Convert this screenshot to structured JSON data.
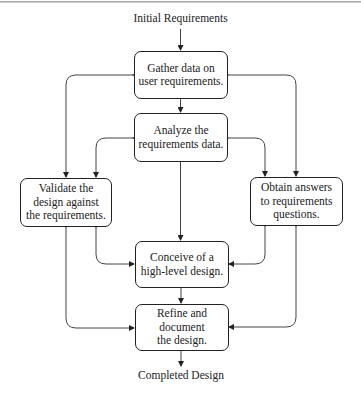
{
  "diagram": {
    "type": "flowchart",
    "input_label": "Initial Requirements",
    "output_label": "Completed Design",
    "nodes": {
      "gather": "Gather data on\nuser requirements.",
      "analyze": "Analyze the\nrequirements data.",
      "validate": "Validate the\ndesign against\nthe requirements.",
      "obtain": "Obtain answers\nto requirements\nquestions.",
      "conceive": "Conceive of a\nhigh-level design.",
      "refine": "Refine and\ndocument\nthe design."
    },
    "edges": [
      {
        "from": "Initial Requirements",
        "to": "gather"
      },
      {
        "from": "gather",
        "to": "analyze"
      },
      {
        "from": "analyze",
        "to": "conceive"
      },
      {
        "from": "conceive",
        "to": "refine"
      },
      {
        "from": "refine",
        "to": "Completed Design"
      },
      {
        "between": [
          "validate",
          "gather"
        ],
        "bidirectional": true
      },
      {
        "between": [
          "validate",
          "analyze"
        ],
        "bidirectional": true
      },
      {
        "between": [
          "validate",
          "conceive"
        ],
        "bidirectional": true
      },
      {
        "between": [
          "validate",
          "refine"
        ],
        "bidirectional": true
      },
      {
        "between": [
          "obtain",
          "gather"
        ],
        "bidirectional": true
      },
      {
        "between": [
          "obtain",
          "analyze"
        ],
        "bidirectional": true
      },
      {
        "between": [
          "obtain",
          "conceive"
        ],
        "bidirectional": true
      },
      {
        "between": [
          "obtain",
          "refine"
        ],
        "bidirectional": true
      }
    ]
  }
}
